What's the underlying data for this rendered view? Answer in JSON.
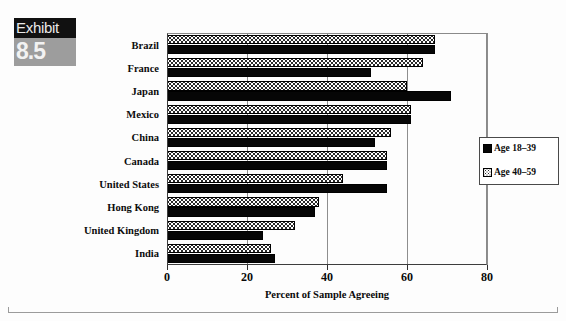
{
  "exhibit": {
    "word": "Exhibit",
    "number": "8.5"
  },
  "chart_data": {
    "type": "bar",
    "orientation": "horizontal",
    "title": "",
    "xlabel": "Percent of Sample Agreeing",
    "ylabel": "",
    "xlim": [
      0,
      80
    ],
    "xticks": [
      0,
      20,
      40,
      60,
      80
    ],
    "xtick_labels": [
      "0",
      "20",
      "40",
      "60",
      "80"
    ],
    "grid": true,
    "grid_axis": "x",
    "legend_position": "right",
    "categories": [
      "Brazil",
      "France",
      "Japan",
      "Mexico",
      "China",
      "Canada",
      "United States",
      "Hong Kong",
      "United Kingdom",
      "India"
    ],
    "series": [
      {
        "name": "Age 18-39",
        "fill": "solid-black",
        "color": "#060606",
        "values": [
          67,
          51,
          71,
          61,
          52,
          55,
          55,
          37,
          24,
          27
        ]
      },
      {
        "name": "Age 40-59",
        "fill": "checkered",
        "color": "#ffffff",
        "values": [
          67,
          64,
          60,
          61,
          56,
          55,
          44,
          38,
          32,
          26
        ]
      }
    ]
  },
  "legend": {
    "items": [
      {
        "label": "Age 18–39",
        "swatch": "solid-black"
      },
      {
        "label": "Age 40–59",
        "swatch": "checkered"
      }
    ]
  },
  "colors": {
    "series_1": "#060606",
    "series_2": "#ffffff",
    "axis": "#2f2f2f",
    "grid": "#8e8e8e",
    "badge_band": "#111111",
    "badge_box": "#9d9d9d"
  }
}
